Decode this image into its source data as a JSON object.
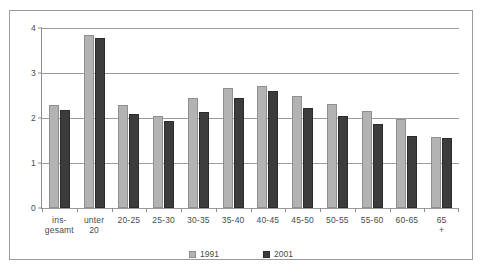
{
  "chart_data": {
    "type": "bar",
    "title": "",
    "xlabel": "",
    "ylabel": "",
    "ylim": [
      0,
      4
    ],
    "yticks": [
      0,
      1,
      2,
      3,
      4
    ],
    "ytick_labels": [
      "0",
      "1",
      "2",
      "3",
      "4"
    ],
    "grid": true,
    "legend_position": "bottom",
    "categories": [
      "ins-\ngesamt",
      "unter\n20",
      "20-25",
      "25-30",
      "30-35",
      "35-40",
      "40-45",
      "45-50",
      "50-55",
      "55-60",
      "60-65",
      "65 +"
    ],
    "series": [
      {
        "name": "1991",
        "color": "#b3b3b3",
        "values": [
          2.29,
          3.85,
          2.28,
          2.05,
          2.45,
          2.67,
          2.72,
          2.49,
          2.32,
          2.16,
          1.97,
          1.57
        ]
      },
      {
        "name": "2001",
        "color": "#3c3c3c",
        "values": [
          2.18,
          3.78,
          2.09,
          1.93,
          2.14,
          2.45,
          2.6,
          2.22,
          2.05,
          1.86,
          1.6,
          1.56
        ]
      }
    ]
  },
  "legend": {
    "entries": [
      {
        "label": "1991"
      },
      {
        "label": "2001"
      }
    ]
  }
}
